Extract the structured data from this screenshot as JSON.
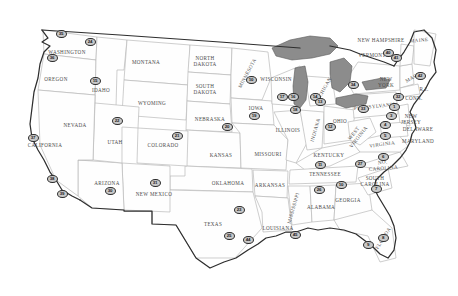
{
  "map": {
    "title": "United States numbered location map",
    "background_color": "#ffffff",
    "outline_color": "#2e2e2e",
    "state_fill_color": "#fefefe",
    "state_border_color": "#b9b9b9",
    "lake_fill_color": "#8c8c8c",
    "marker_fill_color": "#c9c9c9",
    "marker_border_color": "#2b2b2b"
  },
  "state_labels": [
    {
      "name": "WASHINGTON",
      "x": 67,
      "y": 52,
      "rot": ""
    },
    {
      "name": "OREGON",
      "x": 56,
      "y": 79,
      "rot": ""
    },
    {
      "name": "IDAHO",
      "x": 101,
      "y": 90,
      "rot": ""
    },
    {
      "name": "MONTANA",
      "x": 146,
      "y": 62,
      "rot": ""
    },
    {
      "name": "WYOMING",
      "x": 152,
      "y": 103,
      "rot": ""
    },
    {
      "name": "NEVADA",
      "x": 75,
      "y": 125,
      "rot": ""
    },
    {
      "name": "UTAH",
      "x": 115,
      "y": 142,
      "rot": ""
    },
    {
      "name": "COLORADO",
      "x": 163,
      "y": 145,
      "rot": ""
    },
    {
      "name": "CALIFORNIA",
      "x": 45,
      "y": 145,
      "rot": ""
    },
    {
      "name": "ARIZONA",
      "x": 107,
      "y": 183,
      "rot": ""
    },
    {
      "name": "NEW MEXICO",
      "x": 154,
      "y": 194,
      "rot": ""
    },
    {
      "name": "NORTH\nDAKOTA",
      "x": 205,
      "y": 61,
      "rot": ""
    },
    {
      "name": "SOUTH\nDAKOTA",
      "x": 205,
      "y": 89,
      "rot": ""
    },
    {
      "name": "NEBRASKA",
      "x": 210,
      "y": 119,
      "rot": ""
    },
    {
      "name": "KANSAS",
      "x": 221,
      "y": 155,
      "rot": ""
    },
    {
      "name": "OKLAHOMA",
      "x": 228,
      "y": 183,
      "rot": ""
    },
    {
      "name": "TEXAS",
      "x": 213,
      "y": 224,
      "rot": ""
    },
    {
      "name": "MINNESOTA",
      "x": 247,
      "y": 73,
      "rot": "rot-mn"
    },
    {
      "name": "IOWA",
      "x": 256,
      "y": 108,
      "rot": ""
    },
    {
      "name": "MISSOURI",
      "x": 268,
      "y": 154,
      "rot": ""
    },
    {
      "name": "ARKANSAS",
      "x": 270,
      "y": 185,
      "rot": ""
    },
    {
      "name": "LOUISIANA",
      "x": 278,
      "y": 228,
      "rot": ""
    },
    {
      "name": "WISCONSIN",
      "x": 276,
      "y": 79,
      "rot": ""
    },
    {
      "name": "ILLINOIS",
      "x": 288,
      "y": 130,
      "rot": ""
    },
    {
      "name": "MISSISSIPPI",
      "x": 293,
      "y": 208,
      "rot": "rot-ms"
    },
    {
      "name": "INDIANA",
      "x": 315,
      "y": 130,
      "rot": "rot-in"
    },
    {
      "name": "MICHIGAN",
      "x": 323,
      "y": 90,
      "rot": "rot-mi"
    },
    {
      "name": "OHIO",
      "x": 340,
      "y": 121,
      "rot": ""
    },
    {
      "name": "KENTUCKY",
      "x": 329,
      "y": 155,
      "rot": ""
    },
    {
      "name": "TENNESSEE",
      "x": 325,
      "y": 174,
      "rot": ""
    },
    {
      "name": "ALABAMA",
      "x": 321,
      "y": 207,
      "rot": ""
    },
    {
      "name": "GEORGIA",
      "x": 348,
      "y": 200,
      "rot": ""
    },
    {
      "name": "WEST\nVIRGINIA",
      "x": 356,
      "y": 135,
      "rot": "rot-wv"
    },
    {
      "name": "VIRGINIA",
      "x": 382,
      "y": 144,
      "rot": "rot-va"
    },
    {
      "name": "NO.\nCAROLINA",
      "x": 383,
      "y": 165,
      "rot": "rot-nc"
    },
    {
      "name": "SOUTH\nCAROLINA",
      "x": 375,
      "y": 181,
      "rot": ""
    },
    {
      "name": "FLORIDA",
      "x": 383,
      "y": 238,
      "rot": "rot-fl"
    },
    {
      "name": "PENNSYLVANIA",
      "x": 375,
      "y": 106,
      "rot": "rot-pa"
    },
    {
      "name": "NEW\nYORK",
      "x": 386,
      "y": 82,
      "rot": ""
    },
    {
      "name": "NEW\nJERSEY",
      "x": 411,
      "y": 119,
      "rot": ""
    },
    {
      "name": "DELAWARE",
      "x": 418,
      "y": 129,
      "rot": ""
    },
    {
      "name": "MARYLAND",
      "x": 418,
      "y": 141,
      "rot": ""
    },
    {
      "name": "CONN.",
      "x": 414,
      "y": 98,
      "rot": ""
    },
    {
      "name": "R.I.",
      "x": 424,
      "y": 89,
      "rot": ""
    },
    {
      "name": "MASS.",
      "x": 413,
      "y": 77,
      "rot": "rot-ma"
    },
    {
      "name": "VERMONT",
      "x": 372,
      "y": 55,
      "rot": ""
    },
    {
      "name": "NEW HAMPSHIRE",
      "x": 381,
      "y": 40,
      "rot": ""
    },
    {
      "name": "MAINE",
      "x": 419,
      "y": 40,
      "rot": "rot-me"
    }
  ],
  "markers": [
    {
      "id": "35",
      "x": 61,
      "y": 34
    },
    {
      "id": "24",
      "x": 90,
      "y": 42
    },
    {
      "id": "36",
      "x": 52,
      "y": 58
    },
    {
      "id": "15",
      "x": 95,
      "y": 81
    },
    {
      "id": "22",
      "x": 117,
      "y": 121
    },
    {
      "id": "21",
      "x": 177,
      "y": 136
    },
    {
      "id": "37",
      "x": 33,
      "y": 138
    },
    {
      "id": "38",
      "x": 52,
      "y": 179
    },
    {
      "id": "39",
      "x": 62,
      "y": 194
    },
    {
      "id": "30",
      "x": 110,
      "y": 191
    },
    {
      "id": "31",
      "x": 155,
      "y": 183
    },
    {
      "id": "20",
      "x": 227,
      "y": 127
    },
    {
      "id": "19",
      "x": 254,
      "y": 116
    },
    {
      "id": "10",
      "x": 251,
      "y": 80
    },
    {
      "id": "17",
      "x": 282,
      "y": 97
    },
    {
      "id": "16",
      "x": 293,
      "y": 97
    },
    {
      "id": "18",
      "x": 295,
      "y": 110
    },
    {
      "id": "14",
      "x": 315,
      "y": 97
    },
    {
      "id": "13",
      "x": 320,
      "y": 102
    },
    {
      "id": "12",
      "x": 330,
      "y": 127
    },
    {
      "id": "34",
      "x": 353,
      "y": 85
    },
    {
      "id": "33",
      "x": 363,
      "y": 109
    },
    {
      "id": "32",
      "x": 398,
      "y": 97
    },
    {
      "id": "42",
      "x": 420,
      "y": 76
    },
    {
      "id": "40",
      "x": 388,
      "y": 53
    },
    {
      "id": "41",
      "x": 396,
      "y": 58
    },
    {
      "id": "1",
      "x": 394,
      "y": 107
    },
    {
      "id": "3",
      "x": 391,
      "y": 116
    },
    {
      "id": "4",
      "x": 385,
      "y": 125
    },
    {
      "id": "5",
      "x": 385,
      "y": 136
    },
    {
      "id": "6",
      "x": 383,
      "y": 157
    },
    {
      "id": "27",
      "x": 360,
      "y": 164
    },
    {
      "id": "7",
      "x": 376,
      "y": 189
    },
    {
      "id": "10b",
      "x": 341,
      "y": 185
    },
    {
      "id": "26",
      "x": 319,
      "y": 190
    },
    {
      "id": "11",
      "x": 320,
      "y": 165
    },
    {
      "id": "23",
      "x": 239,
      "y": 210
    },
    {
      "id": "25",
      "x": 229,
      "y": 236
    },
    {
      "id": "44",
      "x": 248,
      "y": 240
    },
    {
      "id": "45",
      "x": 295,
      "y": 235
    },
    {
      "id": "9",
      "x": 368,
      "y": 245
    },
    {
      "id": "8",
      "x": 383,
      "y": 238
    }
  ]
}
